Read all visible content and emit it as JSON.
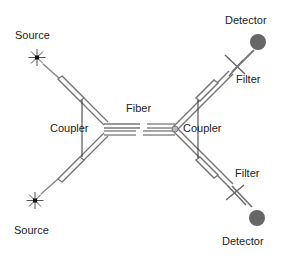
{
  "diagram": {
    "labels": {
      "source_top": "Source",
      "source_bottom": "Source",
      "coupler_left": "Coupler",
      "coupler_right": "Coupler",
      "fiber": "Fiber",
      "detector_top": "Detector",
      "detector_bottom": "Detector",
      "filter_top": "Filter",
      "filter_bottom": "Filter"
    },
    "colors": {
      "fiber_stroke": "#7a7a7a",
      "fiber_fill": "#ffffff",
      "detector": "#666666",
      "line": "#444444"
    }
  }
}
